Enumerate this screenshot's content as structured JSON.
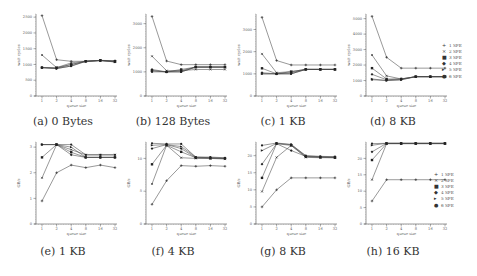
{
  "figure": {
    "series_names": [
      "1 SPE",
      "2 SPE",
      "3 SPE",
      "4 SPE",
      "5 SPE",
      "6 SPE"
    ],
    "markers": [
      "+",
      "×",
      "■",
      "◆",
      "▸",
      "●"
    ],
    "x_ticks": [
      "1",
      "2",
      "4",
      "8",
      "16",
      "32"
    ],
    "xlabel": "queue size"
  },
  "captions": {
    "a": "(a) 0 Bytes",
    "b": "(b) 128 Bytes",
    "c": "(c) 1 KB",
    "d": "(d) 8 KB",
    "e": "(e) 1 KB",
    "f": "(f) 4 KB",
    "g": "(g) 8 KB",
    "h": "(h) 16 KB"
  },
  "legend_top": [
    "1 SPE",
    "2 SPE",
    "3 SPE",
    "4 SPE",
    "5 SPE",
    "6 SPE"
  ],
  "legend_bottom": [
    "1 SPE",
    "2 SPE",
    "3 SPE",
    "4 SPE",
    "5 SPE",
    "6 SPE"
  ],
  "chart_data": [
    {
      "id": "a",
      "type": "line",
      "title": "(a) 0 Bytes",
      "xlabel": "queue size",
      "ylabel": "wait cycles",
      "categories": [
        "1",
        "2",
        "4",
        "8",
        "16",
        "32"
      ],
      "yticks": [
        0,
        500,
        1000,
        1500,
        2000,
        2500
      ],
      "ylim": [
        0,
        2600
      ],
      "series": [
        {
          "name": "1 SPE",
          "values": [
            2550,
            1150,
            1100,
            1100,
            1130,
            1120
          ]
        },
        {
          "name": "2 SPE",
          "values": [
            1300,
            900,
            1050,
            1100,
            1130,
            1100
          ]
        },
        {
          "name": "3 SPE",
          "values": [
            900,
            900,
            1000,
            1100,
            1130,
            1100
          ]
        },
        {
          "name": "4 SPE",
          "values": [
            900,
            880,
            1000,
            1100,
            1130,
            1080
          ]
        },
        {
          "name": "5 SPE",
          "values": [
            900,
            870,
            950,
            1100,
            1120,
            1080
          ]
        },
        {
          "name": "6 SPE",
          "values": [
            900,
            870,
            950,
            1100,
            1120,
            1100
          ]
        }
      ]
    },
    {
      "id": "b",
      "type": "line",
      "title": "(b) 128 Bytes",
      "xlabel": "queue size",
      "ylabel": "wait cycles",
      "categories": [
        "1",
        "2",
        "4",
        "8",
        "16",
        "32"
      ],
      "yticks": [
        0,
        1000,
        2000,
        3000
      ],
      "ylim": [
        0,
        3400
      ],
      "series": [
        {
          "name": "1 SPE",
          "values": [
            3300,
            1450,
            1300,
            1300,
            1300,
            1300
          ]
        },
        {
          "name": "2 SPE",
          "values": [
            1650,
            1050,
            1050,
            1100,
            1100,
            1100
          ]
        },
        {
          "name": "3 SPE",
          "values": [
            1050,
            1000,
            1100,
            1200,
            1200,
            1200
          ]
        },
        {
          "name": "4 SPE",
          "values": [
            1100,
            1000,
            1050,
            1200,
            1200,
            1200
          ]
        },
        {
          "name": "5 SPE",
          "values": [
            1050,
            1000,
            1000,
            1200,
            1200,
            1200
          ]
        },
        {
          "name": "6 SPE",
          "values": [
            1000,
            1000,
            1000,
            1200,
            1200,
            1200
          ]
        }
      ]
    },
    {
      "id": "c",
      "type": "line",
      "title": "(c) 1 KB",
      "xlabel": "queue size",
      "ylabel": "wait cycles",
      "categories": [
        "1",
        "2",
        "4",
        "8",
        "16",
        "32"
      ],
      "yticks": [
        0,
        1000,
        2000,
        3000
      ],
      "ylim": [
        0,
        3700
      ],
      "series": [
        {
          "name": "1 SPE",
          "values": [
            3550,
            1600,
            1400,
            1400,
            1400,
            1400
          ]
        },
        {
          "name": "2 SPE",
          "values": [
            1900,
            1050,
            1100,
            1200,
            1200,
            1200
          ]
        },
        {
          "name": "3 SPE",
          "values": [
            1250,
            1000,
            1100,
            1200,
            1200,
            1200
          ]
        },
        {
          "name": "4 SPE",
          "values": [
            1050,
            1000,
            1050,
            1200,
            1200,
            1200
          ]
        },
        {
          "name": "5 SPE",
          "values": [
            1000,
            1000,
            1000,
            1200,
            1200,
            1200
          ]
        },
        {
          "name": "6 SPE",
          "values": [
            1000,
            1000,
            1000,
            1200,
            1200,
            1200
          ]
        }
      ]
    },
    {
      "id": "d",
      "type": "line",
      "title": "(d) 8 KB",
      "xlabel": "queue size",
      "ylabel": "wait cycles",
      "categories": [
        "1",
        "2",
        "4",
        "8",
        "16",
        "32"
      ],
      "yticks": [
        0,
        1000,
        2000,
        3000,
        4000,
        5000
      ],
      "ylim": [
        0,
        5300
      ],
      "series": [
        {
          "name": "1 SPE",
          "values": [
            5150,
            2500,
            1800,
            1800,
            1800,
            1800
          ]
        },
        {
          "name": "2 SPE",
          "values": [
            2650,
            1300,
            1100,
            1250,
            1250,
            1250
          ]
        },
        {
          "name": "3 SPE",
          "values": [
            1800,
            1100,
            1100,
            1250,
            1250,
            1250
          ]
        },
        {
          "name": "4 SPE",
          "values": [
            1400,
            1050,
            1100,
            1250,
            1250,
            1250
          ]
        },
        {
          "name": "5 SPE",
          "values": [
            1100,
            1000,
            1050,
            1250,
            1250,
            1250
          ]
        },
        {
          "name": "6 SPE",
          "values": [
            1050,
            1000,
            1050,
            1250,
            1250,
            1250
          ]
        }
      ]
    },
    {
      "id": "e",
      "type": "line",
      "title": "(e) 1 KB",
      "xlabel": "queue size",
      "ylabel": "GB/s",
      "categories": [
        "1",
        "2",
        "4",
        "8",
        "16",
        "32"
      ],
      "yticks": [
        0,
        1,
        2,
        3
      ],
      "ylim": [
        0,
        3.2
      ],
      "series": [
        {
          "name": "1 SPE",
          "values": [
            0.9,
            2.0,
            2.3,
            2.2,
            2.3,
            2.2
          ]
        },
        {
          "name": "2 SPE",
          "values": [
            1.8,
            3.1,
            2.9,
            2.7,
            2.7,
            2.7
          ]
        },
        {
          "name": "3 SPE",
          "values": [
            2.6,
            3.1,
            2.8,
            2.6,
            2.6,
            2.6
          ]
        },
        {
          "name": "4 SPE",
          "values": [
            3.1,
            3.1,
            2.7,
            2.6,
            2.6,
            2.6
          ]
        },
        {
          "name": "5 SPE",
          "values": [
            3.1,
            3.1,
            3.0,
            2.6,
            2.6,
            2.6
          ]
        },
        {
          "name": "6 SPE",
          "values": [
            3.1,
            3.1,
            3.1,
            2.7,
            2.7,
            2.7
          ]
        }
      ]
    },
    {
      "id": "f",
      "type": "line",
      "title": "(f) 4 KB",
      "xlabel": "queue size",
      "ylabel": "GB/s",
      "categories": [
        "1",
        "2",
        "4",
        "8",
        "16",
        "32"
      ],
      "yticks": [
        0,
        5,
        10
      ],
      "ylim": [
        0,
        12.5
      ],
      "series": [
        {
          "name": "1 SPE",
          "values": [
            3.0,
            6.6,
            8.9,
            8.8,
            8.9,
            8.8
          ]
        },
        {
          "name": "2 SPE",
          "values": [
            6.1,
            12.0,
            10.1,
            10.0,
            10.0,
            9.9
          ]
        },
        {
          "name": "3 SPE",
          "values": [
            9.1,
            12.0,
            11.0,
            10.1,
            10.0,
            10.0
          ]
        },
        {
          "name": "4 SPE",
          "values": [
            11.5,
            12.1,
            11.5,
            10.1,
            10.1,
            10.0
          ]
        },
        {
          "name": "5 SPE",
          "values": [
            12.0,
            12.1,
            11.8,
            10.2,
            10.1,
            10.0
          ]
        },
        {
          "name": "6 SPE",
          "values": [
            12.3,
            12.2,
            12.2,
            10.2,
            10.2,
            10.1
          ]
        }
      ]
    },
    {
      "id": "g",
      "type": "line",
      "title": "(g) 8 KB",
      "xlabel": "queue size",
      "ylabel": "GB/s",
      "categories": [
        "1",
        "2",
        "4",
        "8",
        "16",
        "32"
      ],
      "yticks": [
        0,
        5,
        10,
        15,
        20
      ],
      "ylim": [
        0,
        24
      ],
      "series": [
        {
          "name": "1 SPE",
          "values": [
            5.0,
            10.0,
            13.5,
            13.5,
            13.5,
            13.5
          ]
        },
        {
          "name": "2 SPE",
          "values": [
            9.5,
            19.5,
            23.0,
            19.5,
            19.4,
            19.4
          ]
        },
        {
          "name": "3 SPE",
          "values": [
            13.5,
            23.5,
            23.0,
            19.7,
            19.5,
            19.4
          ]
        },
        {
          "name": "4 SPE",
          "values": [
            17.5,
            23.5,
            21.5,
            19.8,
            19.6,
            19.5
          ]
        },
        {
          "name": "5 SPE",
          "values": [
            21.5,
            23.6,
            23.2,
            19.9,
            19.7,
            19.6
          ]
        },
        {
          "name": "6 SPE",
          "values": [
            23.0,
            23.7,
            23.3,
            20.0,
            19.8,
            19.7
          ]
        }
      ]
    },
    {
      "id": "h",
      "type": "line",
      "title": "(h) 16 KB",
      "xlabel": "queue size",
      "ylabel": "GB/s",
      "categories": [
        "1",
        "2",
        "4",
        "8",
        "16",
        "32"
      ],
      "yticks": [
        0,
        5,
        10,
        15,
        20
      ],
      "ylim": [
        0,
        25
      ],
      "series": [
        {
          "name": "1 SPE",
          "values": [
            7.0,
            13.5,
            13.5,
            13.5,
            13.5,
            13.5
          ]
        },
        {
          "name": "2 SPE",
          "values": [
            13.5,
            24.5,
            24.5,
            24.5,
            24.5,
            24.5
          ]
        },
        {
          "name": "3 SPE",
          "values": [
            19.5,
            24.5,
            24.5,
            24.5,
            24.5,
            24.5
          ]
        },
        {
          "name": "4 SPE",
          "values": [
            22.0,
            24.6,
            24.6,
            24.6,
            24.6,
            24.6
          ]
        },
        {
          "name": "5 SPE",
          "values": [
            24.0,
            24.6,
            24.6,
            24.6,
            24.6,
            24.6
          ]
        },
        {
          "name": "6 SPE",
          "values": [
            24.5,
            24.6,
            24.6,
            24.6,
            24.6,
            24.6
          ]
        }
      ]
    }
  ]
}
